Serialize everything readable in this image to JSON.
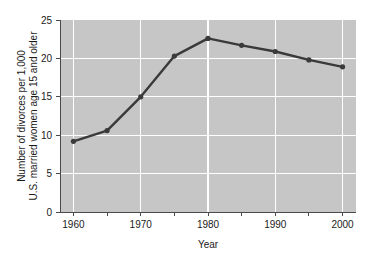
{
  "chart_data": {
    "type": "line",
    "title": "",
    "xlabel": "Year",
    "ylabel": "Number of divorces per 1,000 U.S. married women age 15 and older",
    "ylabel_line1": "Number of divorces per 1,000",
    "ylabel_line2": "U.S. married women age 15 and older",
    "x": [
      1960,
      1965,
      1970,
      1975,
      1980,
      1985,
      1990,
      1995,
      2000
    ],
    "values": [
      9.2,
      10.6,
      15.0,
      20.3,
      22.6,
      21.7,
      20.9,
      19.8,
      18.9
    ],
    "series": [
      {
        "name": "Divorce rate",
        "values": [
          9.2,
          10.6,
          15.0,
          20.3,
          22.6,
          21.7,
          20.9,
          19.8,
          18.9
        ]
      }
    ],
    "xlim": [
      1958,
      2002
    ],
    "ylim": [
      0,
      25
    ],
    "x_ticks": [
      1960,
      1965,
      1970,
      1975,
      1980,
      1985,
      1990,
      1995,
      2000
    ],
    "x_tick_labels": [
      "1960",
      "",
      "1970",
      "",
      "1980",
      "",
      "1990",
      "",
      "2000"
    ],
    "y_ticks": [
      0,
      5,
      10,
      15,
      20,
      25
    ],
    "y_tick_labels": [
      "0",
      "5",
      "10",
      "15",
      "20",
      "25"
    ],
    "grid": true,
    "grid_color": "#ffffff",
    "legend": false,
    "legend_position": "none",
    "plot_background": "#c6c6c6",
    "figure_background": "#ffffff",
    "line_color": "#3a3a3a",
    "marker": "circle",
    "marker_color": "#3a3a3a"
  },
  "axes": {
    "x_axis_label": "Year",
    "y_axis_label_line1": "Number of divorces per 1,000",
    "y_axis_label_line2": "U.S. married women age 15 and older"
  },
  "ticks": {
    "y": [
      "25",
      "20",
      "15",
      "10",
      "5",
      "0"
    ],
    "x": [
      "1960",
      "1970",
      "1980",
      "1990",
      "2000"
    ]
  }
}
